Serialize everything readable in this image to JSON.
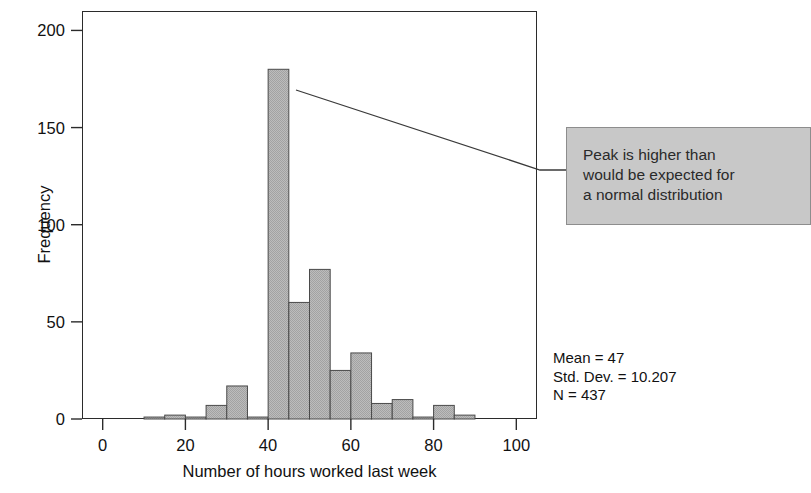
{
  "chart_data": {
    "type": "bar",
    "title": "",
    "subtitle": "",
    "xlabel": "Number of hours worked last week",
    "ylabel": "Frequency",
    "xlim": [
      -5,
      105
    ],
    "ylim": [
      0,
      210
    ],
    "xticks": [
      0,
      20,
      40,
      60,
      80,
      100
    ],
    "xtick_labels": [
      "0",
      "20",
      "40",
      "60",
      "80",
      "100"
    ],
    "yticks": [
      0,
      50,
      100,
      150,
      200
    ],
    "ytick_labels": [
      "0",
      "50",
      "100",
      "150",
      "200"
    ],
    "grid": false,
    "legend": null,
    "bin_width": 5,
    "bin_starts": [
      10,
      15,
      20,
      25,
      30,
      35,
      40,
      45,
      50,
      55,
      60,
      65,
      70,
      75,
      80,
      85,
      90
    ],
    "categories": [
      "10-15",
      "15-20",
      "20-25",
      "25-30",
      "30-35",
      "35-40",
      "40-45",
      "45-50",
      "50-55",
      "55-60",
      "60-65",
      "65-70",
      "70-75",
      "75-80",
      "80-85",
      "85-90",
      "90-95"
    ],
    "values": [
      1,
      2,
      1,
      7,
      17,
      1,
      180,
      60,
      77,
      25,
      34,
      8,
      10,
      1,
      7,
      2,
      0
    ],
    "bar_fill": "#b4b4b4",
    "bar_edge": "#4a4a4a"
  },
  "axes": {
    "y_title": "Frequency",
    "x_title": "Number of hours worked last week",
    "frame_color": "#2b2b2b"
  },
  "annotation": {
    "line1": "Peak is higher than",
    "line2": "would be expected for",
    "line3": "a normal distribution",
    "full_text": "Peak is higher than would be expected for a normal distribution",
    "box_fill": "#c8c8c8",
    "box_border": "#8d8d8d",
    "leader_from": "peak-bar",
    "leader_color": "#3a3a3a"
  },
  "statistics": {
    "mean_label": "Mean = 47",
    "std_dev_label": "Std. Dev. = 10.207",
    "n_label": "N = 437",
    "mean": 47,
    "std_dev": 10.207,
    "n": 437
  }
}
